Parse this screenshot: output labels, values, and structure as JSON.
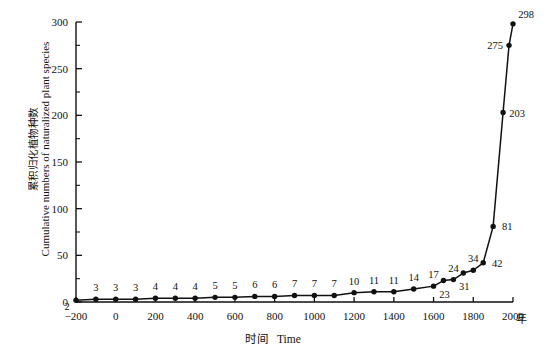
{
  "chart_data": {
    "type": "line",
    "title": "",
    "subtitle": "",
    "xlabel_cn": "时间",
    "xlabel_en": "Time",
    "xunit": "年",
    "ylabel_cn": "累积归化植物种数",
    "ylabel_en": "Cumulative numbers of naturalized plant species",
    "xlim": [
      -200,
      2000
    ],
    "ylim": [
      0,
      300
    ],
    "xticks": [
      -200,
      0,
      200,
      400,
      600,
      800,
      1000,
      1200,
      1400,
      1600,
      1800,
      2000
    ],
    "xtick_labels": [
      "−200",
      "0",
      "200",
      "400",
      "600",
      "800",
      "1000",
      "1200",
      "1400",
      "1600",
      "1800",
      "2000"
    ],
    "yticks": [
      0,
      50,
      100,
      150,
      200,
      250,
      300
    ],
    "ytick_labels": [
      "0",
      "50",
      "100",
      "150",
      "200",
      "250",
      "300"
    ],
    "yticks_minor": [
      25,
      75,
      125,
      175,
      225,
      275
    ],
    "grid": false,
    "legend": false,
    "marker": "filled-circle",
    "line_color": "#111111",
    "x": [
      -200,
      -100,
      0,
      100,
      200,
      300,
      400,
      500,
      600,
      700,
      800,
      900,
      1000,
      1100,
      1200,
      1300,
      1400,
      1500,
      1600,
      1650,
      1700,
      1750,
      1800,
      1850,
      1900,
      1950,
      1980,
      2000
    ],
    "values": [
      2,
      3,
      3,
      3,
      4,
      4,
      4,
      5,
      5,
      6,
      6,
      7,
      7,
      7,
      10,
      11,
      11,
      14,
      17,
      23,
      24,
      31,
      34,
      42,
      81,
      203,
      275,
      298
    ],
    "point_labels": [
      "2",
      "3",
      "3",
      "3",
      "4",
      "4",
      "4",
      "5",
      "5",
      "6",
      "6",
      "7",
      "7",
      "7",
      "10",
      "11",
      "11",
      "14",
      "17",
      "23",
      "24",
      "31",
      "34",
      "42",
      "81",
      "203",
      "275",
      "298"
    ],
    "point_label_positions": [
      "below-left",
      "above",
      "above",
      "above",
      "above",
      "above",
      "above",
      "above",
      "above",
      "above",
      "above",
      "above",
      "above",
      "above",
      "above",
      "above",
      "above",
      "above",
      "above",
      "below",
      "above",
      "below",
      "above",
      "right",
      "right",
      "right",
      "left",
      "above-right"
    ]
  }
}
